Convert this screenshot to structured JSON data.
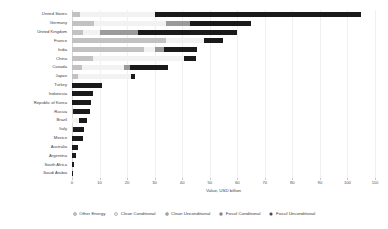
{
  "chart_data": {
    "type": "bar",
    "orientation": "horizontal",
    "stacked": true,
    "title": "",
    "xlabel": "Value, USD billion",
    "ylabel": "",
    "xlim": [
      0,
      110
    ],
    "xticks": [
      0,
      10,
      20,
      30,
      40,
      50,
      60,
      70,
      80,
      90,
      100,
      110
    ],
    "xtick_labels": [
      "0",
      "10",
      "20",
      "30",
      "40",
      "50",
      "60",
      "70",
      "80",
      "90",
      "100",
      "110"
    ],
    "grid": true,
    "legend_position": "bottom",
    "categories": [
      "United States",
      "Germany",
      "United Kingdom",
      "France",
      "India",
      "China",
      "Canada",
      "Japan",
      "Turkey",
      "Indonesia",
      "Republic of Korea",
      "Russia",
      "Brazil",
      "Italy",
      "Mexico",
      "Australia",
      "Argentina",
      "South Africa",
      "Saudi Arabia"
    ],
    "series": [
      {
        "name": "Other Energy",
        "color": "#c2c2c2",
        "values": [
          3.0,
          8.0,
          4.0,
          34.0,
          26.0,
          7.5,
          3.5,
          2.0,
          0.0,
          0.0,
          0.0,
          0.5,
          0.0,
          0.4,
          0.0,
          0.0,
          0.0,
          0.0,
          0.0
        ]
      },
      {
        "name": "Clean Conditional",
        "color": "#f2f2f2",
        "values": [
          27.0,
          26.0,
          6.0,
          14.0,
          4.0,
          33.0,
          15.5,
          19.5,
          0.0,
          0.0,
          0.0,
          0.0,
          2.5,
          0.0,
          0.0,
          0.0,
          0.0,
          0.0,
          0.0
        ]
      },
      {
        "name": "Clean Unconditional",
        "color": "#9a9a9a",
        "values": [
          0.0,
          9.0,
          14.0,
          0.0,
          3.5,
          0.0,
          2.0,
          0.0,
          0.0,
          0.0,
          0.0,
          0.0,
          0.0,
          0.0,
          0.0,
          0.0,
          0.0,
          0.0,
          0.0
        ]
      },
      {
        "name": "Fossil Conditional",
        "color": "#6e6e6e",
        "values": [
          0.0,
          0.0,
          0.0,
          0.0,
          0.0,
          0.0,
          0.0,
          0.0,
          0.0,
          0.0,
          0.0,
          0.0,
          0.0,
          0.0,
          0.0,
          0.0,
          0.0,
          0.0,
          0.0
        ]
      },
      {
        "name": "Fossil Unconditional",
        "color": "#1a1a1a",
        "values": [
          75.0,
          22.0,
          36.0,
          7.0,
          12.0,
          4.5,
          14.0,
          1.5,
          11.0,
          7.5,
          7.0,
          6.0,
          3.0,
          4.0,
          4.0,
          2.0,
          1.5,
          0.8,
          0.5
        ]
      }
    ],
    "totals": [
      105.0,
      65.0,
      60.0,
      55.0,
      45.5,
      45.0,
      35.0,
      23.0,
      11.0,
      7.5,
      7.0,
      6.5,
      5.5,
      4.4,
      4.0,
      2.0,
      1.5,
      0.8,
      0.5
    ]
  }
}
